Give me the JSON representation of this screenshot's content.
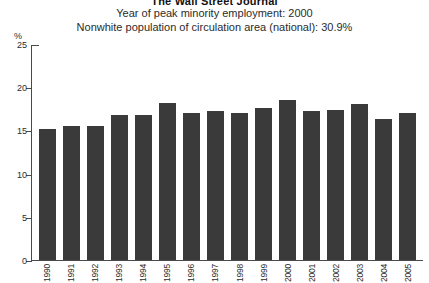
{
  "publication": "The Wall Street Journal",
  "subtitle_line1": "Year of peak minority employment: 2000",
  "subtitle_line2": "Nonwhite population of circulation area (national): 30.9%",
  "unit_label": "%",
  "colors": {
    "bar": "#3a3a3a",
    "axis": "#4a4a4a",
    "text": "#2b2b2b",
    "background": "#ffffff"
  },
  "chart_data": {
    "type": "bar",
    "title": "The Wall Street Journal",
    "subtitle": "Year of peak minority employment: 2000",
    "note": "Nonwhite population of circulation area (national): 30.9%",
    "xlabel": "",
    "ylabel": "%",
    "ylim": [
      0,
      25
    ],
    "yticks": [
      0,
      5,
      10,
      15,
      20,
      25
    ],
    "grid": false,
    "legend": "none",
    "categories": [
      "1990",
      "1991",
      "1992",
      "1993",
      "1994",
      "1995",
      "1996",
      "1997",
      "1998",
      "1999",
      "2000",
      "2001",
      "2002",
      "2003",
      "2004",
      "2005"
    ],
    "values": [
      15.2,
      15.5,
      15.5,
      16.8,
      16.8,
      18.2,
      17.0,
      17.2,
      17.0,
      17.6,
      18.5,
      17.2,
      17.4,
      18.1,
      16.3,
      17.0
    ],
    "peak_year": "2000",
    "peak_value": 18.5
  }
}
